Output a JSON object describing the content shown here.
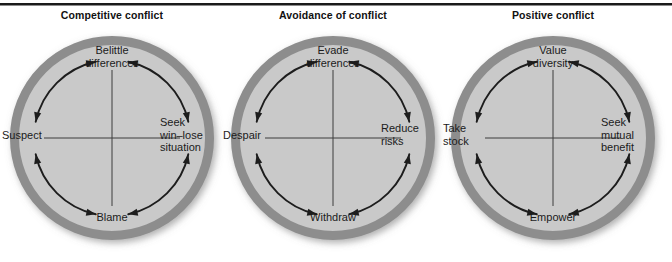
{
  "figure": {
    "background_color": "#ffffff",
    "rule_color": "#1a1a1a",
    "ring_color": "#8d8d8d",
    "disc_color": "#c9c9c9",
    "arrow_color": "#1d1d1d",
    "axis_color": "#3d3d3d",
    "text_color": "#1b1b1b"
  },
  "panels": [
    {
      "title": "Competitive conflict",
      "labels": {
        "top": "Belittle\ndifferences",
        "right": "Seek\nwin–lose\nsituation",
        "bottom": "Blame",
        "left": "Suspect"
      }
    },
    {
      "title": "Avoidance of conflict",
      "labels": {
        "top": "Evade\ndifferences",
        "right": "Reduce\nrisks",
        "bottom": "Withdraw",
        "left": "Despair"
      }
    },
    {
      "title": "Positive conflict",
      "labels": {
        "top": "Value\ndiversity",
        "right": "Seek\nmutual\nbenefit",
        "bottom": "Empower",
        "left": "Take\nstock"
      }
    }
  ]
}
